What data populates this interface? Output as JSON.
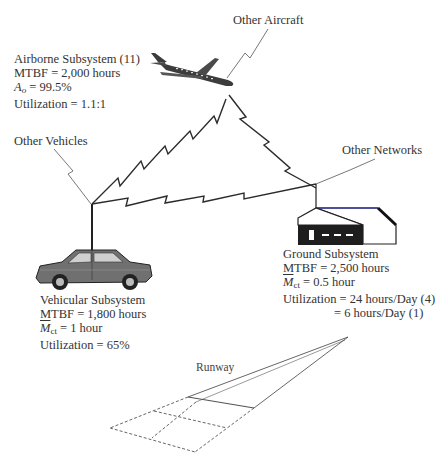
{
  "diagram": {
    "labels": {
      "other_aircraft": "Other Aircraft",
      "other_vehicles": "Other Vehicles",
      "other_networks": "Other Networks",
      "runway": "Runway"
    },
    "airborne": {
      "title": "Airborne Subsystem (11)",
      "mtbf": "MTBF = 2,000 hours",
      "ao_symbol": "A",
      "ao_sub": "o",
      "ao_value": " = 99.5%",
      "utilization": "Utilization = 1.1:1"
    },
    "ground": {
      "title": "Ground Subsystem",
      "mtbf": "MTBF = 2,500 hours",
      "mct_symbol": "M",
      "mct_sub": "ct",
      "mct_value": " = 0.5 hour",
      "utilization_1": "Utilization = 24 hours/Day (4)",
      "utilization_2": "= 6 hours/Day (1)"
    },
    "vehicular": {
      "title": "Vehicular Subsystem",
      "mtbf": "MTBF = 1,800 hours",
      "mct_symbol": "M",
      "mct_sub": "ct",
      "mct_value": " = 1 hour",
      "utilization": "Utilization = 65%"
    },
    "icons": [
      "airplane-icon",
      "car-icon",
      "building-icon",
      "runway-icon"
    ],
    "colors": {
      "ink": "#333333",
      "link": "#2b2b2b",
      "roof_accent": "#3a3aa0"
    }
  }
}
